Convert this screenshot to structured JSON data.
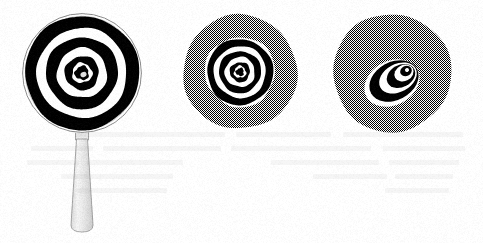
{
  "figure": {
    "title": "Three concentric-ring bullseye targets",
    "background_color": "#ffffff",
    "ink_color": "#000000",
    "gray_tone_color": "#808080",
    "gray_rendering": "50% checkerboard halftone dither",
    "width": 483,
    "height": 243,
    "panel_count": 3,
    "panels": [
      {
        "id": "panel-a",
        "name": "handheld-bullseye-target",
        "description": "Bullseye target on a white disc with a tapered handle below, like a hand mirror or magnifier",
        "center_x": 82,
        "center_y": 73,
        "radius": 60,
        "disc_fill": "#ffffff",
        "has_rim_outline": true,
        "rim_outline_color": "#8a8a8a",
        "has_handle": true,
        "handle_fill": "#e9e9e9",
        "handle_outline": "#9a9a9a",
        "handle_top_y": 131,
        "handle_bottom_y": 232,
        "handle_top_width": 11,
        "handle_bottom_width": 22,
        "ring_count": 3,
        "center_dot": true,
        "center_dot_highlight": true,
        "rings": [
          {
            "outer_radius": 57,
            "inner_radius": 45,
            "color": "#000000"
          },
          {
            "outer_radius": 36,
            "inner_radius": 25,
            "color": "#000000"
          },
          {
            "outer_radius": 17,
            "inner_radius": 10,
            "color": "#000000"
          },
          {
            "outer_radius": 7,
            "inner_radius": 0,
            "color": "#000000"
          }
        ]
      },
      {
        "id": "panel-b",
        "name": "gray-disc-centered-bullseye",
        "description": "Gray halftone disc with a smaller concentric bullseye centered inside",
        "center_x": 240,
        "center_y": 72,
        "radius": 57,
        "disc_fill": "#808080",
        "has_rim_outline": false,
        "has_handle": false,
        "ring_count": 3,
        "center_dot": true,
        "center_dot_highlight": false,
        "inner_field_radius": 35,
        "inner_field_fill": "#ffffff",
        "rings": [
          {
            "outer_radius": 33,
            "inner_radius": 26,
            "color": "#000000"
          },
          {
            "outer_radius": 21,
            "inner_radius": 15,
            "color": "#000000"
          },
          {
            "outer_radius": 10,
            "inner_radius": 6,
            "color": "#000000"
          },
          {
            "outer_radius": 4,
            "inner_radius": 0,
            "color": "#000000"
          }
        ]
      },
      {
        "id": "panel-c",
        "name": "gray-disc-offset-eccentric-bullseye",
        "description": "Gray halftone disc with nested ellipses whose centers are progressively offset toward the upper right, producing an eye or spiral appearance",
        "center_x": 392,
        "center_y": 73,
        "radius": 59,
        "disc_fill": "#808080",
        "has_rim_outline": false,
        "has_handle": false,
        "ring_count": 3,
        "center_dot": true,
        "center_dot_highlight": false,
        "eccentric": true,
        "tilt_degrees": -28,
        "offset_direction": "upper-right",
        "ellipses": [
          {
            "cx": 392,
            "cy": 83,
            "rx": 29,
            "ry": 22,
            "fill": "#ffffff"
          },
          {
            "cx": 394,
            "cy": 81,
            "rx": 26,
            "ry": 19,
            "fill": "#000000"
          },
          {
            "cx": 398,
            "cy": 78,
            "rx": 20,
            "ry": 14,
            "fill": "#ffffff"
          },
          {
            "cx": 401,
            "cy": 76,
            "rx": 15,
            "ry": 11,
            "fill": "#000000"
          },
          {
            "cx": 404,
            "cy": 73,
            "rx": 10,
            "ry": 8,
            "fill": "#ffffff"
          },
          {
            "cx": 406,
            "cy": 71,
            "rx": 6,
            "ry": 5,
            "fill": "#000000"
          },
          {
            "cx": 407,
            "cy": 70,
            "rx": 2,
            "ry": 2,
            "fill": "#ffffff"
          }
        ]
      }
    ],
    "ghost_text": {
      "present": true,
      "legible": false,
      "description": "Very faint mirrored bleed-through text from the reverse of the scanned page",
      "opacity": 0.055,
      "blocks": [
        {
          "x": 20,
          "y": 132,
          "width": 120,
          "height": 5
        },
        {
          "x": 152,
          "y": 132,
          "width": 95,
          "height": 5
        },
        {
          "x": 258,
          "y": 132,
          "width": 150,
          "height": 5
        },
        {
          "x": 18,
          "y": 146,
          "width": 82,
          "height": 5
        },
        {
          "x": 112,
          "y": 146,
          "width": 140,
          "height": 5
        },
        {
          "x": 262,
          "y": 146,
          "width": 118,
          "height": 5
        },
        {
          "x": 390,
          "y": 146,
          "width": 62,
          "height": 5
        },
        {
          "x": 24,
          "y": 160,
          "width": 70,
          "height": 5
        },
        {
          "x": 104,
          "y": 160,
          "width": 108,
          "height": 5
        },
        {
          "x": 300,
          "y": 160,
          "width": 96,
          "height": 5
        },
        {
          "x": 404,
          "y": 160,
          "width": 52,
          "height": 5
        },
        {
          "x": 30,
          "y": 174,
          "width": 58,
          "height": 5
        },
        {
          "x": 96,
          "y": 174,
          "width": 74,
          "height": 5
        },
        {
          "x": 310,
          "y": 174,
          "width": 112,
          "height": 5
        },
        {
          "x": 34,
          "y": 188,
          "width": 64,
          "height": 5
        },
        {
          "x": 316,
          "y": 188,
          "width": 90,
          "height": 5
        }
      ]
    }
  }
}
